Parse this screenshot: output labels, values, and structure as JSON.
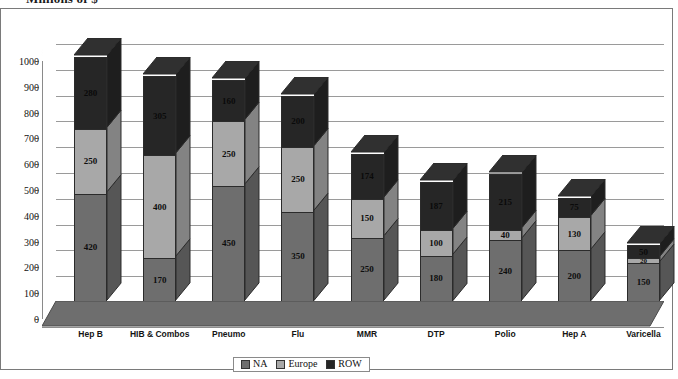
{
  "chart_title": "Millions of $",
  "chart_data": {
    "type": "bar",
    "title": "Millions of $",
    "subtitle": "",
    "xlabel": "",
    "ylabel": "Millions of $",
    "stacked": true,
    "three_d": true,
    "grid": true,
    "legend_position": "bottom",
    "ylim": [
      0,
      1000
    ],
    "yticks": [
      0,
      100,
      200,
      300,
      400,
      500,
      600,
      700,
      800,
      900,
      1000
    ],
    "ytick_labels": [
      "0",
      "100",
      "200",
      "300",
      "400",
      "500",
      "600",
      "700",
      "800",
      "900",
      "1000"
    ],
    "categories": [
      "Hep B",
      "HIB & Combos",
      "Pneumo",
      "Flu",
      "MMR",
      "DTP",
      "Polio",
      "Hep A",
      "Varicella"
    ],
    "series": [
      {
        "name": "NA",
        "color": "#6e6e6e",
        "values": [
          420,
          170,
          450,
          350,
          250,
          180,
          240,
          200,
          150
        ]
      },
      {
        "name": "Europe",
        "color": "#a8a8a8",
        "values": [
          250,
          400,
          250,
          250,
          150,
          100,
          40,
          130,
          20
        ]
      },
      {
        "name": "ROW",
        "color": "#262626",
        "values": [
          280,
          305,
          160,
          200,
          174,
          187,
          215,
          75,
          50
        ]
      }
    ],
    "totals": [
      950,
      875,
      860,
      800,
      574,
      467,
      495,
      405,
      220
    ]
  },
  "legend": {
    "items": [
      {
        "label": "NA",
        "color": "#6e6e6e"
      },
      {
        "label": "Europe",
        "color": "#a8a8a8"
      },
      {
        "label": "ROW",
        "color": "#262626"
      }
    ]
  }
}
